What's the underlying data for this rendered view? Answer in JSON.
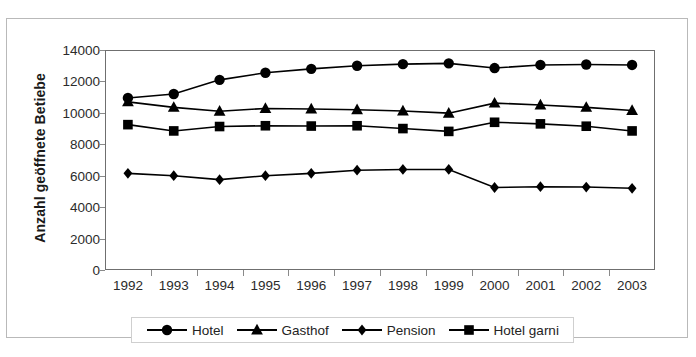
{
  "chart_data": {
    "type": "line",
    "title": "",
    "xlabel": "",
    "ylabel": "Anzahl geöffnete Betiebe",
    "categories": [
      "1992",
      "1993",
      "1994",
      "1995",
      "1996",
      "1997",
      "1998",
      "1999",
      "2000",
      "2001",
      "2002",
      "2003"
    ],
    "ylim": [
      0,
      14000
    ],
    "ytick_values": [
      0,
      2000,
      4000,
      6000,
      8000,
      10000,
      12000,
      14000
    ],
    "ytick_labels": [
      "0",
      "2000",
      "4000",
      "6000",
      "8000",
      "10000",
      "12000",
      "14000"
    ],
    "grid": false,
    "legend_position": "bottom",
    "series": [
      {
        "name": "Hotel",
        "marker": "circle",
        "color": "#000000",
        "values": [
          10950,
          11200,
          12100,
          12550,
          12800,
          13000,
          13100,
          13150,
          12850,
          13050,
          13080,
          13050
        ]
      },
      {
        "name": "Gasthof",
        "marker": "triangle",
        "color": "#000000",
        "values": [
          10700,
          10350,
          10100,
          10280,
          10250,
          10200,
          10120,
          9980,
          10620,
          10500,
          10350,
          10150
        ]
      },
      {
        "name": "Pension",
        "marker": "diamond",
        "color": "#000000",
        "values": [
          6150,
          6000,
          5750,
          6000,
          6150,
          6350,
          6400,
          6400,
          5250,
          5300,
          5280,
          5200
        ]
      },
      {
        "name": "Hotel garni",
        "marker": "square",
        "color": "#000000",
        "values": [
          9250,
          8850,
          9130,
          9180,
          9160,
          9180,
          9000,
          8820,
          9400,
          9300,
          9150,
          8850
        ]
      }
    ]
  },
  "legend": {
    "entries": [
      {
        "label": "Hotel",
        "marker": "circle"
      },
      {
        "label": "Gasthof",
        "marker": "triangle"
      },
      {
        "label": "Pension",
        "marker": "diamond"
      },
      {
        "label": "Hotel garni",
        "marker": "square"
      }
    ]
  }
}
